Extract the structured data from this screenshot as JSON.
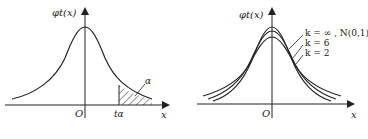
{
  "figures": [
    {
      "id": "left",
      "y_axis_label": "φt(x)",
      "origin_label": "O",
      "x_axis_label": "x",
      "critical_value_label": "tα",
      "area_label": "α",
      "description": "t-distribution density with shaded upper tail area α beyond t_α"
    },
    {
      "id": "right",
      "y_axis_label": "φt(x)",
      "origin_label": "O",
      "x_axis_label": "x",
      "curves": [
        {
          "label": "k = ∞ , N(0,1)"
        },
        {
          "label": "k = 6"
        },
        {
          "label": "k = 2"
        }
      ],
      "description": "t-distribution densities for k=2, k=6, k=∞ (standard normal)"
    }
  ],
  "colors": {
    "line": "#222222",
    "background": "#ffffff"
  }
}
